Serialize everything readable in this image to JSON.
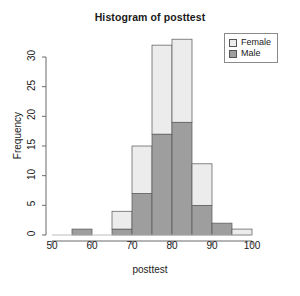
{
  "chart_data": {
    "type": "bar",
    "subtype": "stacked-histogram",
    "title": "Histogram of posttest",
    "xlabel": "posttest",
    "ylabel": "Frequency",
    "xlim": [
      50,
      100
    ],
    "ylim": [
      0,
      33
    ],
    "bin_width": 5,
    "x_ticks": [
      50,
      60,
      70,
      80,
      90,
      100
    ],
    "y_ticks": [
      0,
      5,
      10,
      15,
      20,
      25,
      30
    ],
    "grid": false,
    "legend_position": "top-right",
    "legend": [
      "Female",
      "Male"
    ],
    "colors": {
      "Female": "#ececec",
      "Male": "#9e9e9e",
      "axis": "#6b6b6b",
      "border": "#555555"
    },
    "bins": [
      {
        "start": 50,
        "end": 55,
        "Male": 0,
        "Female": 0,
        "total": 0
      },
      {
        "start": 55,
        "end": 60,
        "Male": 1,
        "Female": 0,
        "total": 1
      },
      {
        "start": 60,
        "end": 65,
        "Male": 0,
        "Female": 0,
        "total": 0
      },
      {
        "start": 65,
        "end": 70,
        "Male": 1,
        "Female": 3,
        "total": 4
      },
      {
        "start": 70,
        "end": 75,
        "Male": 7,
        "Female": 8,
        "total": 15
      },
      {
        "start": 75,
        "end": 80,
        "Male": 17,
        "Female": 15,
        "total": 32
      },
      {
        "start": 80,
        "end": 85,
        "Male": 19,
        "Female": 14,
        "total": 33
      },
      {
        "start": 85,
        "end": 90,
        "Male": 5,
        "Female": 7,
        "total": 12
      },
      {
        "start": 90,
        "end": 95,
        "Male": 2,
        "Female": 0,
        "total": 2
      },
      {
        "start": 95,
        "end": 100,
        "Male": 0,
        "Female": 1,
        "total": 1
      }
    ],
    "series": [
      {
        "name": "Male",
        "values": [
          0,
          1,
          0,
          1,
          7,
          17,
          19,
          5,
          2,
          0
        ]
      },
      {
        "name": "Female",
        "values": [
          0,
          0,
          0,
          3,
          8,
          15,
          14,
          7,
          0,
          1
        ]
      }
    ],
    "categories": [
      "50-55",
      "55-60",
      "60-65",
      "65-70",
      "70-75",
      "75-80",
      "80-85",
      "85-90",
      "90-95",
      "95-100"
    ]
  }
}
